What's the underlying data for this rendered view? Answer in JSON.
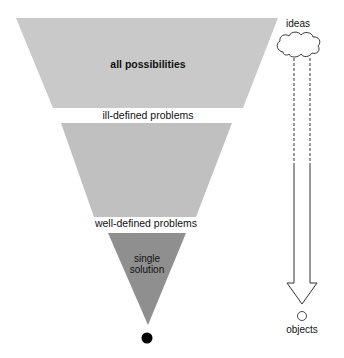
{
  "diagram": {
    "funnel": {
      "stages": [
        {
          "id": "all-possibilities",
          "label": "all possibilities",
          "color": "#c9c9c9"
        },
        {
          "id": "ill-defined-problems",
          "label": "ill-defined problems"
        },
        {
          "id": "middle-band",
          "color": "#c0c0c0"
        },
        {
          "id": "well-defined-problems",
          "label": "well-defined problems"
        },
        {
          "id": "single-solution",
          "label_line1": "single",
          "label_line2": "solution",
          "color": "#8f8f8f"
        }
      ],
      "end_point_color": "#000000"
    },
    "side_arrow": {
      "top_label": "ideas",
      "bottom_label": "objects"
    }
  }
}
